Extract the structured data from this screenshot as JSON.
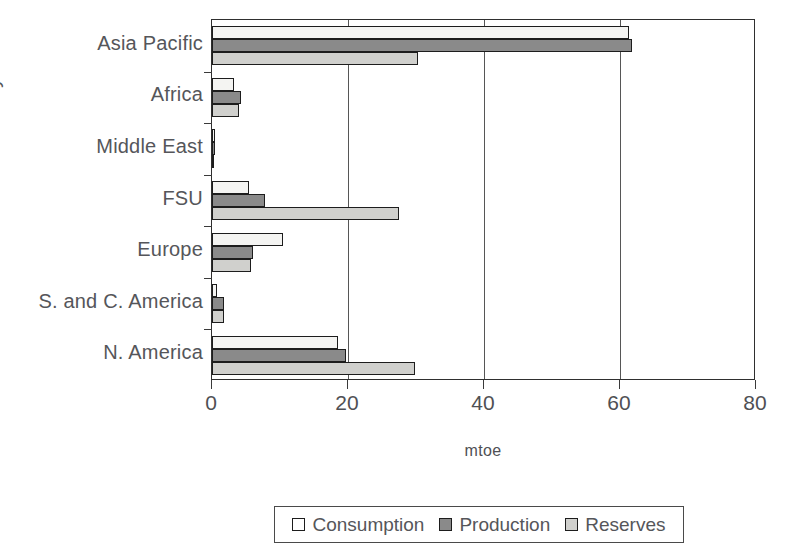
{
  "chart_data": {
    "type": "bar",
    "orientation": "horizontal",
    "title": "",
    "xlabel": "mtoe",
    "ylabel": "",
    "xlim": [
      0,
      80
    ],
    "xticks": [
      0,
      20,
      40,
      60,
      80
    ],
    "xtick_labels": [
      "0",
      "20",
      "40",
      "60",
      "80"
    ],
    "grid": true,
    "legend_position": "bottom",
    "categories": [
      "Asia Pacific",
      "Africa",
      "Middle East",
      "FSU",
      "Europe",
      "S. and C. America",
      "N. America"
    ],
    "series": [
      {
        "name": "Consumption",
        "color": "#f4f4f2",
        "values": [
          61.3,
          3.2,
          0.4,
          5.4,
          10.4,
          0.7,
          18.5
        ]
      },
      {
        "name": "Production",
        "color": "#8a8a8a",
        "values": [
          61.8,
          4.3,
          0.5,
          7.8,
          6.0,
          1.7,
          19.7
        ]
      },
      {
        "name": "Reserves",
        "color": "#d0d0cd",
        "values": [
          30.3,
          4.0,
          0.3,
          27.5,
          5.7,
          1.7,
          29.8
        ]
      }
    ]
  },
  "axis": {
    "unit_label": "mtoe",
    "y_title_fragment": "y"
  },
  "legend": {
    "entries": [
      {
        "label": "Consumption",
        "swatch": "consumption"
      },
      {
        "label": "Production",
        "swatch": "production"
      },
      {
        "label": "Reserves",
        "swatch": "reserves"
      }
    ]
  }
}
